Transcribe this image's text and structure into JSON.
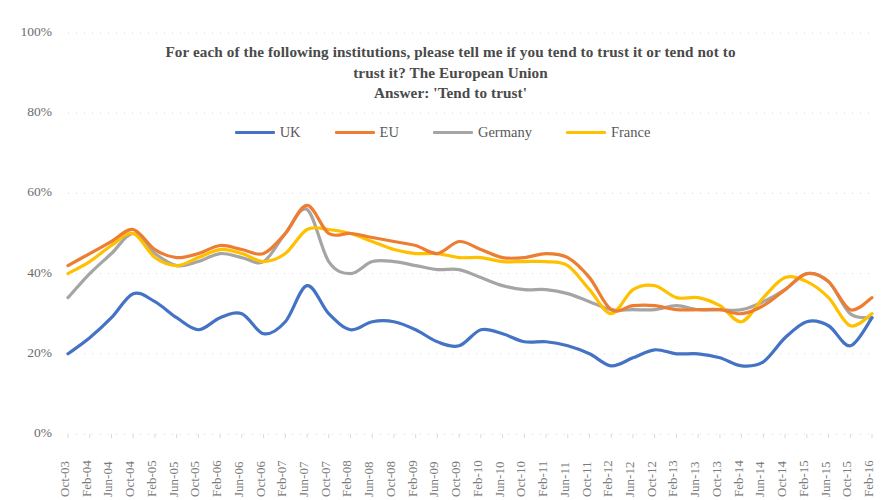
{
  "chart_data": {
    "type": "line",
    "title": "For each of the following institutions, please tell me if you tend to trust it or tend not to trust it? The European Union\nAnswer: 'Tend to trust'",
    "title_lines": [
      "For each of the following institutions, please tell me if you tend to trust it or tend not to",
      "trust it? The European Union",
      "Answer: 'Tend to trust'"
    ],
    "xlabel": "",
    "ylabel": "",
    "ylim": [
      0,
      100
    ],
    "yticks": [
      0,
      20,
      40,
      60,
      80,
      100
    ],
    "ytick_labels": [
      "0%",
      "20%",
      "40%",
      "60%",
      "80%",
      "100%"
    ],
    "grid": true,
    "grid_style": "dotted-horizontal",
    "legend_position": "top-center",
    "categories": [
      "Oct-03",
      "Feb-04",
      "Jun-04",
      "Oct-04",
      "Feb-05",
      "Jun-05",
      "Oct-05",
      "Feb-06",
      "Jun-06",
      "Oct-06",
      "Feb-07",
      "Jun-07",
      "Oct-07",
      "Feb-08",
      "Jun-08",
      "Oct-08",
      "Feb-09",
      "Jun-09",
      "Oct-09",
      "Feb-10",
      "Jun-10",
      "Oct-10",
      "Feb-11",
      "Jun-11",
      "Oct-11",
      "Feb-12",
      "Jun-12",
      "Oct-12",
      "Feb-13",
      "Jun-13",
      "Oct-13",
      "Feb-14",
      "Jun-14",
      "Oct-14",
      "Feb-15",
      "Jun-15",
      "Oct-15",
      "Feb-16"
    ],
    "series": [
      {
        "name": "UK",
        "color": "#4472C4",
        "values": [
          20,
          24,
          29,
          35,
          33,
          29,
          26,
          29,
          30,
          25,
          28,
          37,
          30,
          26,
          28,
          28,
          26,
          23,
          22,
          26,
          25,
          23,
          23,
          22,
          20,
          17,
          19,
          21,
          20,
          20,
          19,
          17,
          18,
          24,
          28,
          27,
          22,
          29
        ]
      },
      {
        "name": "EU",
        "color": "#ED7D31",
        "values": [
          42,
          45,
          48,
          51,
          46,
          44,
          45,
          47,
          46,
          45,
          50,
          57,
          50,
          50,
          49,
          48,
          47,
          45,
          48,
          46,
          44,
          44,
          45,
          44,
          39,
          31,
          32,
          32,
          31,
          31,
          31,
          30,
          32,
          36,
          40,
          38,
          31,
          34
        ]
      },
      {
        "name": "Germany",
        "color": "#A5A5A5",
        "values": [
          34,
          40,
          45,
          50,
          45,
          42,
          43,
          45,
          44,
          43,
          50,
          56,
          43,
          40,
          43,
          43,
          42,
          41,
          41,
          39,
          37,
          36,
          36,
          35,
          33,
          31,
          31,
          31,
          32,
          31,
          31,
          31,
          33,
          36,
          40,
          38,
          30,
          29
        ]
      },
      {
        "name": "France",
        "color": "#FFC000",
        "values": [
          40,
          43,
          47,
          50,
          44,
          42,
          44,
          46,
          45,
          43,
          45,
          51,
          51,
          50,
          48,
          46,
          45,
          45,
          44,
          44,
          43,
          43,
          43,
          42,
          36,
          30,
          36,
          37,
          34,
          34,
          32,
          28,
          34,
          39,
          38,
          34,
          27,
          30
        ]
      }
    ]
  },
  "legend": {
    "items": [
      {
        "label": "UK",
        "color": "#4472C4"
      },
      {
        "label": "EU",
        "color": "#ED7D31"
      },
      {
        "label": "Germany",
        "color": "#A5A5A5"
      },
      {
        "label": "France",
        "color": "#FFC000"
      }
    ]
  }
}
